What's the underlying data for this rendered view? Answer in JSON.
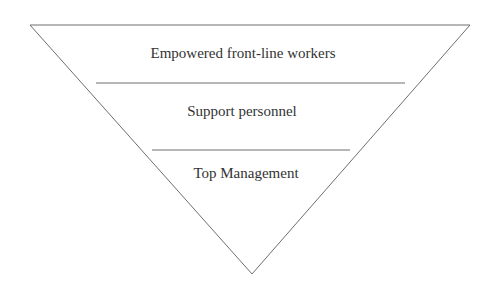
{
  "diagram": {
    "type": "inverted-pyramid",
    "levels": [
      {
        "label": "Empowered front-line workers"
      },
      {
        "label": "Support personnel"
      },
      {
        "label": "Top Management"
      }
    ],
    "colors": {
      "stroke": "#6e6e6e",
      "text": "#333333",
      "background": "#ffffff"
    }
  }
}
